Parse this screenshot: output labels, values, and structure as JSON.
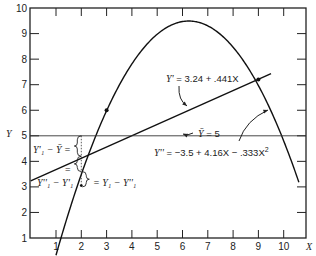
{
  "chart_data": {
    "type": "line",
    "title": "",
    "xlabel": "X",
    "ylabel": "Y",
    "xlim": [
      0,
      11
    ],
    "ylim": [
      1,
      10
    ],
    "x_ticks": [
      "1",
      "2",
      "3",
      "4",
      "5",
      "6",
      "7",
      "8",
      "9",
      "10"
    ],
    "y_ticks": [
      "1",
      "2",
      "3",
      "4",
      "5",
      "6",
      "7",
      "8",
      "9",
      "10"
    ],
    "grid": false,
    "series": [
      {
        "name": "Y' = 3.24 + .441X",
        "kind": "linear",
        "intercept": 3.24,
        "slope": 0.441,
        "x_range": [
          0,
          9.5
        ]
      },
      {
        "name": "Y'' = -3.5 + 4.16X - .333X^2",
        "kind": "quadratic",
        "a": -3.5,
        "b": 4.16,
        "c": -0.333,
        "x_range": [
          1,
          10.6
        ]
      },
      {
        "name": "Y-bar = 5",
        "kind": "horizontal",
        "value": 5
      }
    ],
    "points": [
      {
        "x": 3,
        "y": 6.0
      },
      {
        "x": 9,
        "y": 7.2
      }
    ],
    "annotations": [
      {
        "text": "Y' = 3.24 + .441X",
        "label_part1": "Y'",
        "label_part2": " = 3.24 + .441X"
      },
      {
        "text": "Ȳ = 5",
        "label_part1": "Ȳ",
        "label_part2": " = 5"
      },
      {
        "text": "Y'' = −3.5 + 4.16X − .333X²",
        "label_part1": "Y''",
        "label_part2": " = −3.5 + 4.16X − .333X",
        "sup": "2"
      },
      {
        "text": "Y'₁ − Ȳ =",
        "value": "Y'₁ − Ȳ ="
      },
      {
        "text": "Y''₁ − Y'₁",
        "value": "Y''₁ − Y'₁"
      },
      {
        "text": "=",
        "value": "="
      },
      {
        "text": "= Y₁ − Y''₁",
        "value": "= Y₁ − Y''₁"
      }
    ]
  },
  "axis": {
    "x_label": "X",
    "y_label": "Y"
  }
}
